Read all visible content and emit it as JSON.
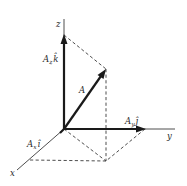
{
  "diagram": {
    "type": "3d-vector-decomposition",
    "axes": {
      "x": {
        "label": "x"
      },
      "y": {
        "label": "y"
      },
      "z": {
        "label": "z"
      }
    },
    "vectors": [
      {
        "name": "A",
        "label": "A"
      },
      {
        "name": "Ax_i",
        "label_main": "A",
        "label_sub": "x",
        "unit": "î"
      },
      {
        "name": "Ay_j",
        "label_main": "A",
        "label_sub": "y",
        "unit": "ĵ"
      },
      {
        "name": "Az_k",
        "label_main": "A",
        "label_sub": "z",
        "unit": "k̂"
      }
    ],
    "colors": {
      "background": "#ffffff",
      "stroke": "#1a1a1a",
      "dashed": "#3a3a3a"
    }
  }
}
